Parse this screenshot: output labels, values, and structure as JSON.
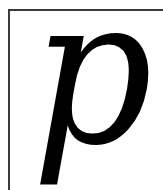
{
  "letter": {
    "char": "p",
    "color": "#000000",
    "style": "italic serif"
  },
  "frame": {
    "border_color": "#3a3a3a"
  }
}
